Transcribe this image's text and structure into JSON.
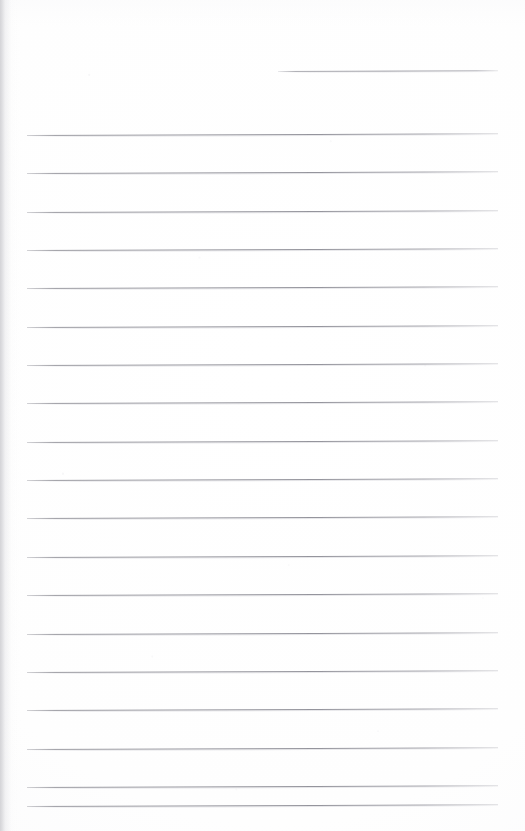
{
  "document": {
    "kind": "lined-notepad-page",
    "title": "Blank ruled notepad page",
    "orientation": "portrait",
    "page_width": 525,
    "page_height": 831,
    "background_color": "#fefefe",
    "rule_color": "#8f8f97",
    "rule_halo_color": "#cbcbd1",
    "edge_shadow_color": "#cdcdd1",
    "has_text": false,
    "visible_text": ""
  },
  "date_rule": {
    "name": "date-line",
    "x": 278,
    "y": 71,
    "width": 220,
    "thickness": 1,
    "value": "",
    "placeholder": ""
  },
  "ruling": {
    "left": 27,
    "right": 498,
    "width": 471,
    "first_line_y": 135,
    "spacing": 38.4,
    "count": 19,
    "skew_degrees": -0.21,
    "lines": [
      {
        "index": 1,
        "y": 135
      },
      {
        "index": 2,
        "y": 173
      },
      {
        "index": 3,
        "y": 212
      },
      {
        "index": 4,
        "y": 250
      },
      {
        "index": 5,
        "y": 288
      },
      {
        "index": 6,
        "y": 327
      },
      {
        "index": 7,
        "y": 365
      },
      {
        "index": 8,
        "y": 403
      },
      {
        "index": 9,
        "y": 442
      },
      {
        "index": 10,
        "y": 480
      },
      {
        "index": 11,
        "y": 518
      },
      {
        "index": 12,
        "y": 557
      },
      {
        "index": 13,
        "y": 595
      },
      {
        "index": 14,
        "y": 634
      },
      {
        "index": 15,
        "y": 672
      },
      {
        "index": 16,
        "y": 710
      },
      {
        "index": 17,
        "y": 749
      },
      {
        "index": 18,
        "y": 787
      },
      {
        "index": 19,
        "y": 806
      }
    ],
    "line_values": [
      "",
      "",
      "",
      "",
      "",
      "",
      "",
      "",
      "",
      "",
      "",
      "",
      "",
      "",
      "",
      "",
      "",
      "",
      ""
    ]
  }
}
